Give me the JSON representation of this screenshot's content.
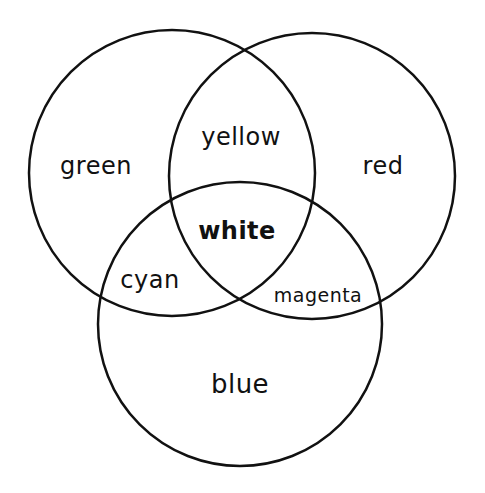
{
  "diagram": {
    "type": "venn",
    "title": "",
    "stroke_color": "#111111",
    "background": "#ffffff",
    "circles": [
      {
        "name": "green",
        "cx": 172,
        "cy": 173,
        "r": 143
      },
      {
        "name": "red",
        "cx": 312,
        "cy": 176,
        "r": 143
      },
      {
        "name": "blue",
        "cx": 240,
        "cy": 324,
        "r": 142
      }
    ],
    "regions": {
      "green": "green",
      "red": "red",
      "blue": "blue",
      "yellow": "yellow",
      "cyan": "cyan",
      "magenta": "magenta",
      "white": "white"
    }
  }
}
